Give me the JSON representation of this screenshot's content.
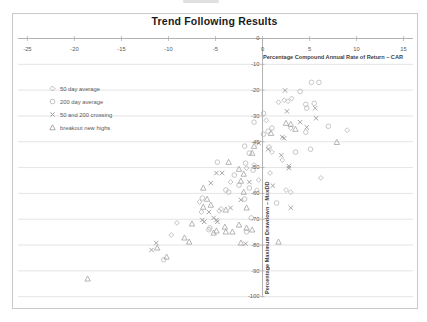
{
  "chart_data": {
    "type": "scatter",
    "title": "Trend Following Results",
    "xlabel": "Percentage Compound Annual Rate of Return – CAR",
    "ylabel": "Percentage Maximum Drawdown – MaxDD",
    "xlim": [
      -26,
      16
    ],
    "ylim": [
      -104,
      0
    ],
    "x_ticks": [
      -25,
      -20,
      -15,
      -10,
      -5,
      0,
      5,
      10,
      15
    ],
    "y_ticks": [
      0,
      -10,
      -20,
      -30,
      -40,
      -50,
      -60,
      -70,
      -80,
      -90,
      -100
    ],
    "grid": "horizontal",
    "legend_position": "inside-top-left",
    "colors": {
      "border": "#c9c9c9",
      "gridline": "#d8d8d8",
      "axis": "#a9a9a9",
      "tick_label": "#595959",
      "axis_title": "#3f3f3f",
      "title": "#1a1a1a"
    },
    "series": [
      {
        "name": "50 day average",
        "marker": "diamond",
        "color": "#b4b4b4",
        "points": [
          [
            1.7,
            -24.7
          ],
          [
            2.3,
            -23.9
          ],
          [
            2.7,
            -24.3
          ],
          [
            3.1,
            -23.2
          ],
          [
            0.4,
            -31.7
          ],
          [
            3.0,
            -34.7
          ],
          [
            9.0,
            -35.5
          ],
          [
            1.0,
            -44.0
          ],
          [
            2.1,
            -47.1
          ],
          [
            -0.9,
            -49.0
          ],
          [
            -1.7,
            -50.2
          ],
          [
            0.8,
            -52.1
          ],
          [
            -3.4,
            -55.6
          ],
          [
            -0.4,
            -54.8
          ],
          [
            -0.6,
            -58.7
          ],
          [
            2.5,
            -58.7
          ],
          [
            3.0,
            -59.5
          ],
          [
            6.2,
            -54.0
          ],
          [
            -6.7,
            -63.3
          ],
          [
            -4.4,
            -66.0
          ],
          [
            -4.6,
            -66.8
          ],
          [
            -6.5,
            -67.2
          ],
          [
            -9.1,
            -71.4
          ],
          [
            -9.7,
            -76.1
          ]
        ]
      },
      {
        "name": "200 day average",
        "marker": "circle",
        "color": "#b9b9b9",
        "points": [
          [
            5.2,
            -17.0
          ],
          [
            6.0,
            -17.0
          ],
          [
            4.0,
            -20.5
          ],
          [
            4.6,
            -25.5
          ],
          [
            5.5,
            -25.1
          ],
          [
            4.7,
            -27.0
          ],
          [
            0.1,
            -29.0
          ],
          [
            -0.9,
            -32.4
          ],
          [
            1.0,
            -34.7
          ],
          [
            7.0,
            -34.0
          ],
          [
            0.6,
            -35.9
          ],
          [
            0.1,
            -37.1
          ],
          [
            4.6,
            -36.3
          ],
          [
            -1.9,
            -41.7
          ],
          [
            0.7,
            -42.1
          ],
          [
            5.1,
            -42.9
          ],
          [
            3.5,
            -44.0
          ],
          [
            -1.4,
            -44.4
          ],
          [
            -4.8,
            -47.9
          ],
          [
            -1.8,
            -48.3
          ],
          [
            -1.0,
            -51.0
          ],
          [
            -3.0,
            -52.9
          ],
          [
            -2.5,
            -56.8
          ],
          [
            -1.4,
            -57.9
          ],
          [
            -3.9,
            -58.7
          ],
          [
            -3.6,
            -59.5
          ],
          [
            -6.4,
            -61.8
          ],
          [
            -1.9,
            -62.2
          ],
          [
            1.5,
            -63.7
          ],
          [
            -1.2,
            -69.5
          ],
          [
            -5.6,
            -73.4
          ],
          [
            -5.7,
            -74.1
          ],
          [
            -1.7,
            -74.9
          ],
          [
            -10.5,
            -85.7
          ]
        ]
      },
      {
        "name": "50 and 200 crossing",
        "marker": "x",
        "color": "#9c9c9c",
        "points": [
          [
            2.4,
            -20.1
          ],
          [
            2.6,
            -28.2
          ],
          [
            5.6,
            -27.0
          ],
          [
            5.7,
            -30.9
          ],
          [
            4.0,
            -32.4
          ],
          [
            4.7,
            -34.4
          ],
          [
            2.1,
            -38.2
          ],
          [
            2.3,
            -38.6
          ],
          [
            -0.4,
            -40.5
          ],
          [
            0.6,
            -42.9
          ],
          [
            2.0,
            -45.2
          ],
          [
            2.8,
            -49.4
          ],
          [
            2.8,
            -50.2
          ],
          [
            1.1,
            -57.0
          ],
          [
            -4.9,
            -52.1
          ],
          [
            -4.3,
            -52.1
          ],
          [
            -5.5,
            -56.0
          ],
          [
            -1.4,
            -55.6
          ],
          [
            -2.3,
            -62.5
          ],
          [
            -3.4,
            -65.6
          ],
          [
            3.0,
            -65.6
          ],
          [
            -5.7,
            -67.2
          ],
          [
            -5.2,
            -69.5
          ],
          [
            -6.4,
            -70.3
          ],
          [
            -4.9,
            -70.3
          ],
          [
            -4.8,
            -71.0
          ],
          [
            -6.2,
            -71.0
          ],
          [
            -11.3,
            -79.2
          ],
          [
            -11.8,
            -81.9
          ],
          [
            -1.8,
            -79.5
          ]
        ]
      },
      {
        "name": "breakout new highs",
        "marker": "triangle",
        "color": "#a3a3a3",
        "points": [
          [
            2.5,
            -32.8
          ],
          [
            3.0,
            -33.2
          ],
          [
            3.5,
            -35.1
          ],
          [
            0.9,
            -36.7
          ],
          [
            7.9,
            -40.2
          ],
          [
            -0.9,
            -41.7
          ],
          [
            -1.1,
            -44.4
          ],
          [
            -3.6,
            -47.9
          ],
          [
            -2.5,
            -50.6
          ],
          [
            -2.0,
            -52.5
          ],
          [
            -2.3,
            -55.2
          ],
          [
            -6.3,
            -57.9
          ],
          [
            -2.0,
            -59.5
          ],
          [
            -5.9,
            -62.2
          ],
          [
            -5.5,
            -64.5
          ],
          [
            -6.3,
            -65.3
          ],
          [
            -1.7,
            -65.6
          ],
          [
            -3.9,
            -66.4
          ],
          [
            -7.5,
            -71.8
          ],
          [
            -2.5,
            -72.2
          ],
          [
            -4.0,
            -73.0
          ],
          [
            -1.7,
            -73.4
          ],
          [
            -1.1,
            -74.1
          ],
          [
            -4.9,
            -74.5
          ],
          [
            -3.2,
            -74.9
          ],
          [
            -3.9,
            -74.9
          ],
          [
            -5.2,
            -75.3
          ],
          [
            -8.3,
            -77.2
          ],
          [
            -7.8,
            -78.8
          ],
          [
            1.7,
            -78.8
          ],
          [
            -2.3,
            -79.2
          ],
          [
            -11.2,
            -81.1
          ],
          [
            -10.2,
            -84.6
          ],
          [
            -18.6,
            -93.1
          ]
        ]
      }
    ]
  }
}
